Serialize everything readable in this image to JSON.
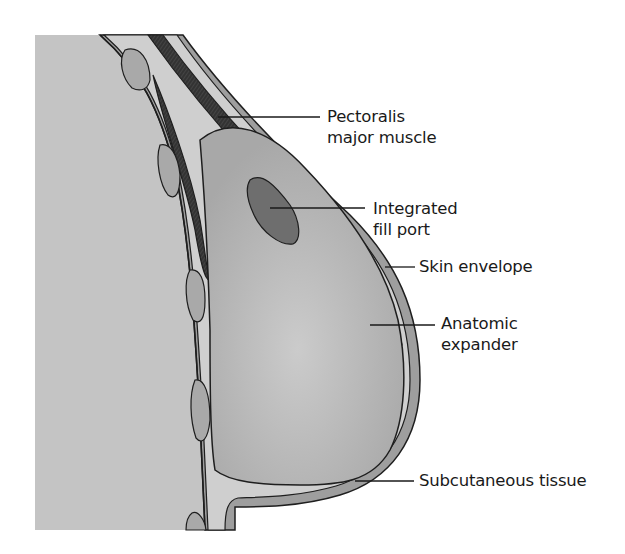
{
  "figure": {
    "type": "anatomical cross-section",
    "colors": {
      "chest_wall": "#c4c4c4",
      "tissue_light": "#cfcfcf",
      "fat_lobule": "#a9a9a9",
      "muscle": "#3a3a3a",
      "expander": "#b3b3b3",
      "expander_highlight": "#c9c9c9",
      "fill_port": "#6e6e6e",
      "skin": "#9e9e9e",
      "outline": "#1e1e1e",
      "background": "#ffffff"
    }
  },
  "labels": [
    {
      "id": "pectoralis",
      "lines": [
        "Pectoralis",
        "major muscle"
      ]
    },
    {
      "id": "fill_port",
      "lines": [
        "Integrated",
        "fill port"
      ]
    },
    {
      "id": "skin",
      "lines": [
        "Skin envelope"
      ]
    },
    {
      "id": "expander",
      "lines": [
        "Anatomic",
        "expander"
      ]
    },
    {
      "id": "subcutaneous",
      "lines": [
        "Subcutaneous tissue"
      ]
    }
  ]
}
